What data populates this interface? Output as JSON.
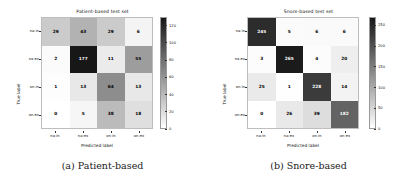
{
  "figure": {
    "panels": [
      {
        "key": "patient",
        "caption": "(a) Patient-based",
        "chart": {
          "type": "heatmap",
          "title": "Patient-based test set",
          "xlabel": "Predicted label",
          "ylabel": "True label",
          "categories": [
            "na-in",
            "na-ex",
            "on-in",
            "on-ex"
          ],
          "row_labels": [
            "na-in",
            "na-ex",
            "on-in",
            "on-ex"
          ],
          "col_labels": [
            "na-in",
            "na-ex",
            "on-in",
            "on-ex"
          ],
          "values": [
            [
              29,
              43,
              29,
              6
            ],
            [
              2,
              177,
              11,
              55
            ],
            [
              1,
              13,
              64,
              13
            ],
            [
              0,
              5,
              38,
              18
            ]
          ],
          "colorbar": {
            "ticks": [
              0,
              20,
              40,
              60,
              80,
              100,
              120
            ],
            "vmin": 0,
            "vmax": 130,
            "colormap": "Greys"
          }
        }
      },
      {
        "key": "snore",
        "caption": "(b) Snore-based",
        "chart": {
          "type": "heatmap",
          "title": "Snore-based test set",
          "xlabel": "Predicted label",
          "ylabel": "True label",
          "categories": [
            "na-in",
            "na-ex",
            "on-in",
            "on-ex"
          ],
          "row_labels": [
            "na-in",
            "na-ex",
            "on-in",
            "on-ex"
          ],
          "col_labels": [
            "na-in",
            "na-ex",
            "on-in",
            "on-ex"
          ],
          "values": [
            [
              245,
              5,
              6,
              6
            ],
            [
              3,
              265,
              4,
              20
            ],
            [
              25,
              1,
              228,
              14
            ],
            [
              0,
              26,
              39,
              182
            ]
          ],
          "colorbar": {
            "ticks": [
              0,
              50,
              100,
              150,
              200,
              250
            ],
            "vmin": 0,
            "vmax": 270,
            "colormap": "Greys"
          }
        }
      }
    ]
  },
  "chart_data": [
    {
      "type": "heatmap",
      "title": "Patient-based test set",
      "xlabel": "Predicted label",
      "ylabel": "True label",
      "x": [
        "na-in",
        "na-ex",
        "on-in",
        "on-ex"
      ],
      "y": [
        "na-in",
        "na-ex",
        "on-in",
        "on-ex"
      ],
      "values": [
        [
          29,
          43,
          29,
          6
        ],
        [
          2,
          177,
          11,
          55
        ],
        [
          1,
          13,
          64,
          13
        ],
        [
          0,
          5,
          38,
          18
        ]
      ],
      "zlim": [
        0,
        130
      ],
      "colorbar_ticks": [
        0,
        20,
        40,
        60,
        80,
        100,
        120
      ],
      "grid": false,
      "legend": "colorbar-right",
      "caption": "(a) Patient-based"
    },
    {
      "type": "heatmap",
      "title": "Snore-based test set",
      "xlabel": "Predicted label",
      "ylabel": "True label",
      "x": [
        "na-in",
        "na-ex",
        "on-in",
        "on-ex"
      ],
      "y": [
        "na-in",
        "na-ex",
        "on-in",
        "on-ex"
      ],
      "values": [
        [
          245,
          5,
          6,
          6
        ],
        [
          3,
          265,
          4,
          20
        ],
        [
          25,
          1,
          228,
          14
        ],
        [
          0,
          26,
          39,
          182
        ]
      ],
      "zlim": [
        0,
        270
      ],
      "colorbar_ticks": [
        0,
        50,
        100,
        150,
        200,
        250
      ],
      "grid": false,
      "legend": "colorbar-right",
      "caption": "(b) Snore-based"
    }
  ]
}
